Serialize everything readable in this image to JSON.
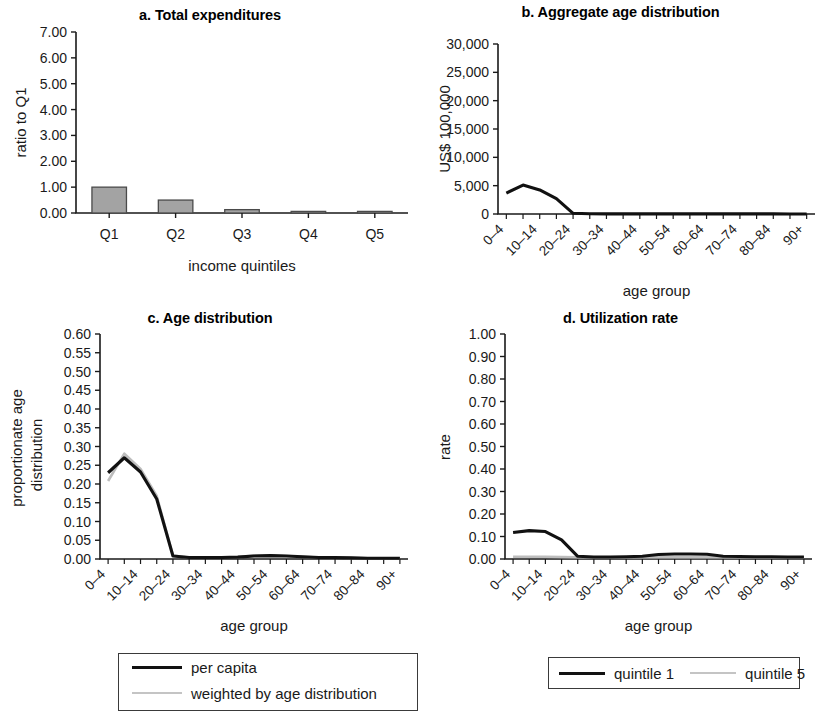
{
  "figure": {
    "panels": [
      "a",
      "b",
      "c",
      "d"
    ]
  },
  "panel_a": {
    "title": "a. Total expenditures",
    "ylabel": "ratio to Q1",
    "xlabel": "income quintiles"
  },
  "panel_b": {
    "title": "b. Aggregate age distribution",
    "ylabel": "US$ 100,000",
    "xlabel": "age group"
  },
  "panel_c": {
    "title": "c. Age distribution",
    "ylabel_line1": "proportionate age",
    "ylabel_line2": "distribution",
    "xlabel": "age group",
    "legend": [
      {
        "label": "per capita",
        "color": "#111111"
      },
      {
        "label": "weighted by age distribution",
        "color": "#c4c4c4"
      }
    ]
  },
  "panel_d": {
    "title": "d. Utilization rate",
    "ylabel": "rate",
    "xlabel": "age group",
    "legend": [
      {
        "label": "quintile 1",
        "color": "#111111"
      },
      {
        "label": "quintile 5",
        "color": "#c4c4c4"
      }
    ]
  },
  "chart_data": [
    {
      "id": "a",
      "type": "bar",
      "title": "a. Total expenditures",
      "xlabel": "income quintiles",
      "ylabel": "ratio to Q1",
      "categories": [
        "Q1",
        "Q2",
        "Q3",
        "Q4",
        "Q5"
      ],
      "values": [
        1.0,
        0.5,
        0.13,
        0.05,
        0.02
      ],
      "ylim": [
        0,
        7
      ],
      "yticks": [
        0,
        1,
        2,
        3,
        4,
        5,
        6,
        7
      ],
      "ytick_labels": [
        "0.00",
        "1.00",
        "2.00",
        "3.00",
        "4.00",
        "5.00",
        "6.00",
        "7.00"
      ],
      "grid": false,
      "legend": "none",
      "bar_fill": "#a3a3a3",
      "bar_edge": "#4a4a4a"
    },
    {
      "id": "b",
      "type": "line",
      "title": "b. Aggregate age distribution",
      "xlabel": "age group",
      "ylabel": "US$ 100,000",
      "categories": [
        "0–4",
        "5–9",
        "10–14",
        "15–19",
        "20–24",
        "25–29",
        "30–34",
        "35–39",
        "40–44",
        "45–49",
        "50–54",
        "55–59",
        "60–64",
        "65–69",
        "70–74",
        "75–79",
        "80–84",
        "85–89",
        "90+"
      ],
      "tick_labels_shown": [
        "0–4",
        "10–14",
        "20–24",
        "30–34",
        "40–44",
        "50–54",
        "60–64",
        "70–74",
        "80–84",
        "90+"
      ],
      "series": [
        {
          "name": "aggregate",
          "color": "#111111",
          "values": [
            3700,
            5100,
            4250,
            2700,
            120,
            40,
            30,
            30,
            25,
            25,
            25,
            20,
            20,
            20,
            15,
            15,
            15,
            10,
            10
          ]
        }
      ],
      "ylim": [
        0,
        30000
      ],
      "yticks": [
        0,
        5000,
        10000,
        15000,
        20000,
        25000,
        30000
      ],
      "ytick_labels": [
        "0",
        "5,000",
        "10,000",
        "15,000",
        "20,000",
        "25,000",
        "30,000"
      ],
      "grid": false,
      "legend": "none"
    },
    {
      "id": "c",
      "type": "line",
      "title": "c. Age distribution",
      "xlabel": "age group",
      "ylabel": "proportionate age distribution",
      "categories": [
        "0–4",
        "5–9",
        "10–14",
        "15–19",
        "20–24",
        "25–29",
        "30–34",
        "35–39",
        "40–44",
        "45–49",
        "50–54",
        "55–59",
        "60–64",
        "65–69",
        "70–74",
        "75–79",
        "80–84",
        "85–89",
        "90+"
      ],
      "tick_labels_shown": [
        "0–4",
        "10–14",
        "20–24",
        "30–34",
        "40–44",
        "50–54",
        "60–64",
        "70–74",
        "80–84",
        "90+"
      ],
      "series": [
        {
          "name": "per capita",
          "color": "#111111",
          "values": [
            0.23,
            0.27,
            0.232,
            0.16,
            0.008,
            0.004,
            0.004,
            0.004,
            0.005,
            0.008,
            0.009,
            0.008,
            0.006,
            0.004,
            0.004,
            0.003,
            0.002,
            0.002,
            0.002
          ]
        },
        {
          "name": "weighted by age distribution",
          "color": "#c4c4c4",
          "values": [
            0.208,
            0.281,
            0.24,
            0.168,
            0.009,
            0.004,
            0.004,
            0.004,
            0.005,
            0.009,
            0.01,
            0.008,
            0.006,
            0.004,
            0.004,
            0.003,
            0.002,
            0.002,
            0.002
          ]
        }
      ],
      "ylim": [
        0,
        0.6
      ],
      "yticks": [
        0,
        0.05,
        0.1,
        0.15,
        0.2,
        0.25,
        0.3,
        0.35,
        0.4,
        0.45,
        0.5,
        0.55,
        0.6
      ],
      "ytick_labels": [
        "0.00",
        "0.05",
        "0.10",
        "0.15",
        "0.20",
        "0.25",
        "0.30",
        "0.35",
        "0.40",
        "0.45",
        "0.50",
        "0.55",
        "0.60"
      ],
      "grid": false,
      "legend": "below"
    },
    {
      "id": "d",
      "type": "line",
      "title": "d. Utilization rate",
      "xlabel": "age group",
      "ylabel": "rate",
      "categories": [
        "0–4",
        "5–9",
        "10–14",
        "15–19",
        "20–24",
        "25–29",
        "30–34",
        "35–39",
        "40–44",
        "45–49",
        "50–54",
        "55–59",
        "60–64",
        "65–69",
        "70–74",
        "75–79",
        "80–84",
        "85–89",
        "90+"
      ],
      "tick_labels_shown": [
        "0–4",
        "10–14",
        "20–24",
        "30–34",
        "40–44",
        "50–54",
        "60–64",
        "70–74",
        "80–84",
        "90+"
      ],
      "series": [
        {
          "name": "quintile 1",
          "color": "#111111",
          "values": [
            0.118,
            0.126,
            0.122,
            0.085,
            0.012,
            0.009,
            0.009,
            0.01,
            0.012,
            0.02,
            0.022,
            0.022,
            0.021,
            0.012,
            0.011,
            0.01,
            0.01,
            0.009,
            0.009
          ]
        },
        {
          "name": "quintile 5",
          "color": "#c4c4c4",
          "values": [
            0.01,
            0.01,
            0.01,
            0.009,
            0.008,
            0.008,
            0.008,
            0.008,
            0.008,
            0.008,
            0.008,
            0.008,
            0.008,
            0.008,
            0.008,
            0.008,
            0.008,
            0.008,
            0.008
          ]
        }
      ],
      "ylim": [
        0,
        1.0
      ],
      "yticks": [
        0,
        0.1,
        0.2,
        0.3,
        0.4,
        0.5,
        0.6,
        0.7,
        0.8,
        0.9,
        1.0
      ],
      "ytick_labels": [
        "0.00",
        "0.10",
        "0.20",
        "0.30",
        "0.40",
        "0.50",
        "0.60",
        "0.70",
        "0.80",
        "0.90",
        "1.00"
      ],
      "grid": false,
      "legend": "below"
    }
  ]
}
